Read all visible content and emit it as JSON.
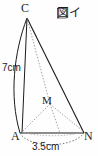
{
  "figure": {
    "title": "図イ",
    "vertex_labels": {
      "apex": "C",
      "base_left": "A",
      "base_right": "N",
      "midpoint": "M"
    },
    "measurements": {
      "height": "7cm",
      "base_diameter": "3.5cm"
    },
    "colors": {
      "stroke": "#1b1b1b",
      "dotted_stroke": "#8a8a8a",
      "background": "#fefefe"
    },
    "geometry": {
      "apex_point": [
        27,
        18
      ],
      "base_left_point": [
        20,
        133
      ],
      "base_right_point": [
        84,
        133
      ],
      "midpoint_point": [
        50,
        104
      ],
      "left_arc_bulge_x": 9,
      "base_arc_bulge_y": 147
    },
    "shape_type": "cone-with-inscribed-triangle"
  }
}
